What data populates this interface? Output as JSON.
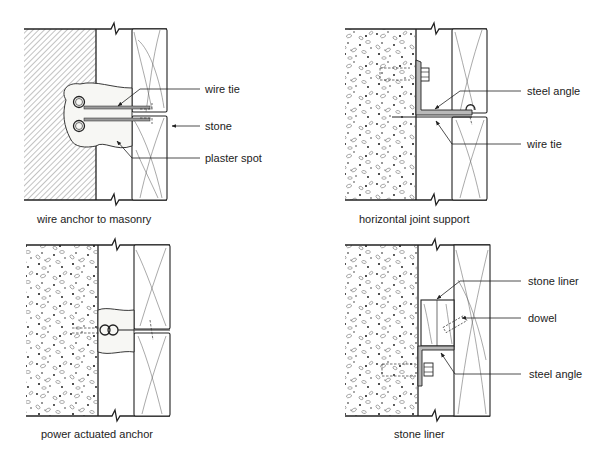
{
  "diagram": {
    "type": "architectural-section-details",
    "colors": {
      "line": "#222222",
      "background": "#ffffff",
      "steel_fill": "#b9b9b9",
      "hatch": "#777777"
    }
  },
  "panels": [
    {
      "id": "wire-anchor-to-masonry",
      "caption": "wire anchor to masonry",
      "backing": "masonry (hatched)",
      "callouts": [
        {
          "label": "wire tie"
        },
        {
          "label": "stone"
        },
        {
          "label": "plaster spot"
        }
      ]
    },
    {
      "id": "horizontal-joint-support",
      "caption": "horizontal joint support",
      "backing": "concrete (stippled)",
      "callouts": [
        {
          "label": "steel angle"
        },
        {
          "label": "wire tie"
        }
      ]
    },
    {
      "id": "power-actuated-anchor",
      "caption": "power actuated anchor",
      "backing": "concrete (stippled)",
      "callouts": []
    },
    {
      "id": "stone-liner",
      "caption": "stone liner",
      "backing": "concrete (stippled)",
      "callouts": [
        {
          "label": "stone liner"
        },
        {
          "label": "dowel"
        },
        {
          "label": "steel angle"
        }
      ]
    }
  ]
}
